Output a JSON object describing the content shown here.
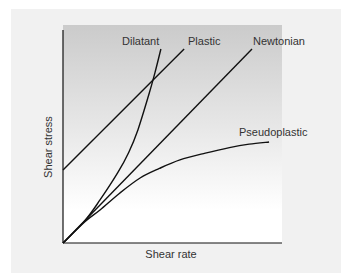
{
  "chart_data": {
    "type": "line",
    "title": "",
    "xlabel": "Shear rate",
    "ylabel": "Shear stress",
    "xlim": [
      0,
      10
    ],
    "ylim": [
      0,
      10
    ],
    "grid": false,
    "legend": "inline-labels",
    "ticks": false,
    "series": [
      {
        "name": "Dilatant",
        "x": [
          0,
          1.0,
          1.69,
          2.5,
          3.0,
          3.42,
          3.9,
          4.2,
          4.47
        ],
        "y": [
          0,
          1.05,
          2.02,
          3.3,
          4.25,
          5.31,
          6.9,
          8.0,
          9.11
        ]
      },
      {
        "name": "Plastic",
        "x": [
          0,
          5.53
        ],
        "y": [
          3.43,
          9.11
        ]
      },
      {
        "name": "Newtonian",
        "x": [
          0,
          8.63
        ],
        "y": [
          0,
          9.11
        ]
      },
      {
        "name": "Pseudoplastic",
        "x": [
          0,
          1.0,
          1.69,
          2.6,
          3.52,
          4.4,
          5.34,
          6.5,
          7.6,
          8.5,
          9.41
        ],
        "y": [
          0,
          1.0,
          1.55,
          2.35,
          3.05,
          3.5,
          3.9,
          4.22,
          4.48,
          4.64,
          4.74
        ]
      }
    ],
    "colors": {
      "panel": "#f1f1f1",
      "plot_top": "#cbcbcb",
      "plot_bottom": "#ffffff",
      "line": "#111111",
      "text": "#333333"
    }
  }
}
